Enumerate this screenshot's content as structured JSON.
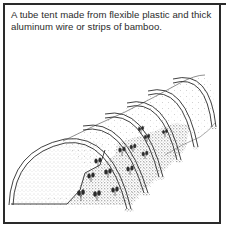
{
  "figure": {
    "caption": "A tube tent made from flexible plastic and thick aluminum wire or strips of bamboo.",
    "illustration": {
      "subject": "tube-tent-icon",
      "hoop_count": 6,
      "description": "Line drawing of a tunnel of plastic sheeting stretched over six hoops, with seedlings growing on stippled soil inside"
    },
    "colors": {
      "border": "#2a2a2a",
      "ink": "#2b2b2b",
      "background": "#ffffff"
    }
  }
}
